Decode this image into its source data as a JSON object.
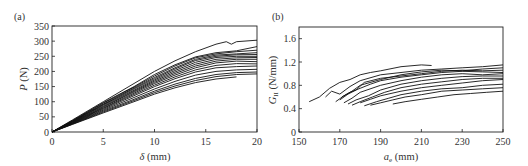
{
  "chart_data": [
    {
      "panel": "(a)",
      "type": "line",
      "title": "",
      "xlabel": "δ (mm)",
      "ylabel": "P (N)",
      "xlim": [
        0,
        20
      ],
      "ylim": [
        0,
        350
      ],
      "xticks": [
        0,
        5,
        10,
        15,
        20
      ],
      "yticks": [
        0,
        50,
        100,
        150,
        200,
        250,
        300,
        350
      ],
      "grid": false,
      "legend": null,
      "series": [
        {
          "name": "specimen 1",
          "x": [
            0,
            2,
            5,
            8,
            10,
            12,
            14,
            16,
            17,
            17.5,
            18,
            20
          ],
          "y": [
            0,
            40,
            100,
            160,
            200,
            235,
            265,
            290,
            298,
            290,
            298,
            303
          ]
        },
        {
          "name": "specimen 2",
          "x": [
            0,
            2,
            5,
            8,
            10,
            12,
            14,
            16,
            18,
            20
          ],
          "y": [
            0,
            38,
            97,
            150,
            190,
            222,
            248,
            262,
            268,
            282
          ]
        },
        {
          "name": "specimen 3",
          "x": [
            0,
            2,
            5,
            8,
            10,
            12,
            14,
            16,
            18,
            20
          ],
          "y": [
            0,
            37,
            95,
            148,
            185,
            218,
            245,
            258,
            265,
            270
          ]
        },
        {
          "name": "specimen 4",
          "x": [
            0,
            2,
            5,
            8,
            10,
            12,
            14,
            16,
            18,
            20
          ],
          "y": [
            0,
            36,
            92,
            145,
            180,
            212,
            240,
            254,
            258,
            262
          ]
        },
        {
          "name": "specimen 5",
          "x": [
            0,
            2,
            5,
            8,
            10,
            12,
            14,
            16,
            18,
            20
          ],
          "y": [
            0,
            35,
            90,
            142,
            176,
            208,
            236,
            250,
            255,
            256
          ]
        },
        {
          "name": "specimen 6",
          "x": [
            0,
            2,
            5,
            8,
            10,
            12,
            14,
            16,
            18,
            20
          ],
          "y": [
            0,
            34,
            88,
            138,
            172,
            203,
            230,
            246,
            250,
            250
          ]
        },
        {
          "name": "specimen 7",
          "x": [
            0,
            2,
            5,
            8,
            10,
            12,
            14,
            16,
            18,
            20
          ],
          "y": [
            0,
            33,
            85,
            135,
            168,
            198,
            224,
            240,
            245,
            246
          ]
        },
        {
          "name": "specimen 8",
          "x": [
            0,
            2,
            5,
            8,
            10,
            12,
            14,
            16,
            18,
            20
          ],
          "y": [
            0,
            32,
            83,
            132,
            164,
            193,
            218,
            234,
            240,
            240
          ]
        },
        {
          "name": "specimen 9",
          "x": [
            0,
            2,
            5,
            8,
            10,
            12,
            14,
            16,
            18,
            20
          ],
          "y": [
            0,
            31,
            80,
            128,
            160,
            188,
            212,
            228,
            234,
            232
          ]
        },
        {
          "name": "specimen 10",
          "x": [
            0,
            2,
            5,
            8,
            10,
            12,
            14,
            16,
            18,
            20
          ],
          "y": [
            0,
            30,
            78,
            124,
            155,
            182,
            205,
            220,
            226,
            225
          ]
        },
        {
          "name": "specimen 11",
          "x": [
            0,
            2,
            5,
            8,
            10,
            12,
            14,
            16,
            18,
            20
          ],
          "y": [
            0,
            29,
            75,
            120,
            150,
            176,
            198,
            212,
            216,
            218
          ]
        },
        {
          "name": "specimen 12",
          "x": [
            0,
            2,
            5,
            8,
            10,
            12,
            14,
            16,
            18,
            20
          ],
          "y": [
            0,
            28,
            72,
            114,
            142,
            167,
            188,
            200,
            205,
            207
          ]
        },
        {
          "name": "specimen 13",
          "x": [
            0,
            2,
            5,
            8,
            10,
            12,
            14,
            16,
            18,
            20
          ],
          "y": [
            0,
            27,
            69,
            108,
            135,
            158,
            177,
            190,
            196,
            198
          ]
        },
        {
          "name": "specimen 14",
          "x": [
            0,
            2,
            5,
            8,
            10,
            12,
            14,
            16,
            18,
            20
          ],
          "y": [
            0,
            26,
            66,
            104,
            130,
            152,
            170,
            183,
            190,
            192
          ]
        },
        {
          "name": "specimen 15",
          "x": [
            0,
            2,
            5,
            8,
            10,
            12,
            14,
            16,
            18
          ],
          "y": [
            0,
            25,
            63,
            100,
            125,
            146,
            163,
            175,
            182
          ]
        }
      ]
    },
    {
      "panel": "(b)",
      "type": "line",
      "title": "",
      "xlabel": "a_e (mm)",
      "ylabel": "G_II (N/mm)",
      "xlim": [
        150,
        250
      ],
      "ylim": [
        0,
        1.8
      ],
      "xticks": [
        150,
        170,
        190,
        210,
        230,
        250
      ],
      "yticks": [
        0,
        0.4,
        0.8,
        1.2,
        1.6
      ],
      "grid": false,
      "legend": null,
      "series": [
        {
          "name": "specimen 1",
          "x": [
            155,
            160,
            165,
            170,
            175,
            180,
            185,
            190,
            200,
            210,
            215
          ],
          "y": [
            0.52,
            0.6,
            0.75,
            0.85,
            0.9,
            0.98,
            1.02,
            1.05,
            1.12,
            1.15,
            1.14
          ]
        },
        {
          "name": "specimen 2",
          "x": [
            163,
            166,
            170,
            175,
            180,
            190,
            200,
            210,
            220,
            230,
            240,
            250
          ],
          "y": [
            0.6,
            0.7,
            0.65,
            0.78,
            0.88,
            0.98,
            1.02,
            1.06,
            1.08,
            1.1,
            1.12,
            1.15
          ]
        },
        {
          "name": "specimen 3",
          "x": [
            168,
            172,
            176,
            180,
            190,
            200,
            210,
            220,
            230,
            240,
            250
          ],
          "y": [
            0.52,
            0.62,
            0.7,
            0.8,
            0.9,
            0.98,
            1.03,
            1.06,
            1.05,
            1.08,
            1.1
          ]
        },
        {
          "name": "specimen 4",
          "x": [
            170,
            174,
            178,
            182,
            190,
            200,
            210,
            220,
            230,
            240,
            250
          ],
          "y": [
            0.55,
            0.65,
            0.72,
            0.85,
            0.92,
            0.96,
            1.0,
            1.04,
            1.06,
            1.05,
            1.06
          ]
        },
        {
          "name": "specimen 5",
          "x": [
            171,
            175,
            180,
            185,
            190,
            200,
            210,
            220,
            230,
            240,
            250
          ],
          "y": [
            0.6,
            0.68,
            0.75,
            0.82,
            0.88,
            0.94,
            0.98,
            1.02,
            1.04,
            1.03,
            1.02
          ]
        },
        {
          "name": "specimen 6",
          "x": [
            172,
            176,
            180,
            190,
            200,
            210,
            220,
            230,
            240,
            250
          ],
          "y": [
            0.5,
            0.58,
            0.68,
            0.8,
            0.88,
            0.94,
            0.98,
            1.0,
            0.98,
            1.0
          ]
        },
        {
          "name": "specimen 7",
          "x": [
            174,
            178,
            184,
            190,
            200,
            210,
            220,
            230,
            240,
            250
          ],
          "y": [
            0.48,
            0.55,
            0.62,
            0.72,
            0.82,
            0.88,
            0.92,
            0.95,
            0.96,
            0.96
          ]
        },
        {
          "name": "specimen 8",
          "x": [
            176,
            180,
            186,
            192,
            200,
            210,
            220,
            230,
            240,
            250
          ],
          "y": [
            0.46,
            0.52,
            0.6,
            0.68,
            0.76,
            0.82,
            0.86,
            0.9,
            0.92,
            0.92
          ]
        },
        {
          "name": "specimen 9",
          "x": [
            180,
            185,
            190,
            200,
            210,
            220,
            230,
            240,
            250
          ],
          "y": [
            0.5,
            0.56,
            0.62,
            0.7,
            0.76,
            0.8,
            0.84,
            0.88,
            0.9
          ]
        },
        {
          "name": "specimen 10",
          "x": [
            182,
            188,
            194,
            200,
            210,
            220,
            230,
            240,
            250
          ],
          "y": [
            0.45,
            0.52,
            0.58,
            0.64,
            0.7,
            0.74,
            0.76,
            0.8,
            0.82
          ]
        },
        {
          "name": "specimen 11",
          "x": [
            185,
            190,
            196,
            202,
            210,
            220,
            230,
            240,
            250
          ],
          "y": [
            0.46,
            0.5,
            0.55,
            0.6,
            0.64,
            0.7,
            0.72,
            0.74,
            0.76
          ]
        },
        {
          "name": "specimen 12",
          "x": [
            196,
            202,
            210,
            218,
            226,
            234,
            242,
            250
          ],
          "y": [
            0.48,
            0.52,
            0.56,
            0.6,
            0.64,
            0.66,
            0.68,
            0.7
          ]
        }
      ]
    }
  ],
  "panels": {
    "a": {
      "label": "(a)",
      "ylabel_italic": "P",
      "ylabel_unit": " (N)",
      "xlabel_symbol": "δ",
      "xlabel_unit": " (mm)",
      "xticks": [
        "0",
        "5",
        "10",
        "15",
        "20"
      ],
      "yticks": [
        "0",
        "50",
        "100",
        "150",
        "200",
        "250",
        "300",
        "350"
      ]
    },
    "b": {
      "label": "(b)",
      "ylabel_italic": "G",
      "ylabel_sub": "II",
      "ylabel_unit": " (N/mm)",
      "xlabel_italic": "a",
      "xlabel_sub": "e",
      "xlabel_unit": " (mm)",
      "xticks": [
        "150",
        "170",
        "190",
        "210",
        "230",
        "250"
      ],
      "yticks": [
        "0",
        "0.4",
        "0.8",
        "1.2",
        "1.6"
      ]
    }
  }
}
